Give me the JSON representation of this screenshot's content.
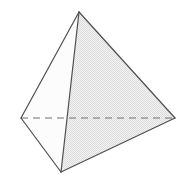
{
  "figure": {
    "name": "tetrahedron",
    "caption": "",
    "background_color": "#ffffff",
    "edge_color": "#4f4f4f",
    "edge_width": 1.1,
    "hidden_edge_color": "#6b6b6b",
    "hidden_edge_dash": "7 5",
    "face_colors": {
      "left_face": "#fbfbfb",
      "right_face": "#e9e9e9",
      "bottom_left_face": "#f7f7f7",
      "bottom_right_face": "#f2f2f2"
    },
    "vertices": {
      "apex": {
        "label": "apex",
        "x": 79,
        "y": 12
      },
      "left": {
        "label": "left",
        "x": 21,
        "y": 118
      },
      "right": {
        "label": "right",
        "x": 175,
        "y": 118
      },
      "front": {
        "label": "front",
        "x": 61,
        "y": 172
      }
    },
    "faces": [
      {
        "name": "left-face",
        "points": "79,12 21,118 61,172",
        "fill": "#fbfbfb"
      },
      {
        "name": "right-face",
        "points": "79,12 175,118 61,172",
        "fill": "#e9e9e9"
      },
      {
        "name": "back-left-face",
        "points": "79,12 21,118 175,118",
        "fill": "#f4f4f4"
      },
      {
        "name": "base-face",
        "points": "21,118 175,118 61,172",
        "fill": "#f7f7f7"
      }
    ],
    "edges": [
      {
        "name": "apex-to-left",
        "x1": 79,
        "y1": 12,
        "x2": 21,
        "y2": 118,
        "hidden": false
      },
      {
        "name": "apex-to-right",
        "x1": 79,
        "y1": 12,
        "x2": 175,
        "y2": 118,
        "hidden": false
      },
      {
        "name": "apex-to-front",
        "x1": 79,
        "y1": 12,
        "x2": 61,
        "y2": 172,
        "hidden": false
      },
      {
        "name": "left-to-front",
        "x1": 21,
        "y1": 118,
        "x2": 61,
        "y2": 172,
        "hidden": false
      },
      {
        "name": "right-to-front",
        "x1": 175,
        "y1": 118,
        "x2": 61,
        "y2": 172,
        "hidden": false
      },
      {
        "name": "left-to-right-hidden",
        "x1": 21,
        "y1": 118,
        "x2": 175,
        "y2": 118,
        "hidden": true
      }
    ]
  }
}
